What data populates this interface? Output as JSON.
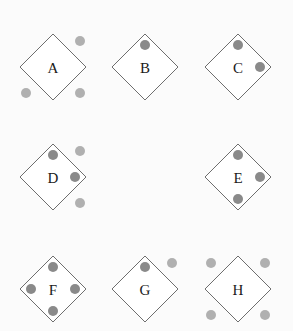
{
  "figure": {
    "colors": {
      "background": "#fbfbfb",
      "diamond_fill": "#ffffff",
      "diamond_stroke": "#6e6e6e",
      "dot_inside": "#8a8a8a",
      "dot_outside": "#b0b0b0",
      "label": "#1a1a1a"
    },
    "options": [
      {
        "label": "A",
        "dots": [
          {
            "position": "outside-top-right",
            "shade": "outside"
          },
          {
            "position": "outside-bottom-left",
            "shade": "outside"
          },
          {
            "position": "outside-bottom-right",
            "shade": "outside"
          }
        ]
      },
      {
        "label": "B",
        "dots": [
          {
            "position": "inside-top",
            "shade": "inside"
          }
        ]
      },
      {
        "label": "C",
        "dots": [
          {
            "position": "inside-top",
            "shade": "inside"
          },
          {
            "position": "inside-right",
            "shade": "inside"
          }
        ]
      },
      {
        "label": "D",
        "dots": [
          {
            "position": "inside-top",
            "shade": "inside"
          },
          {
            "position": "inside-right",
            "shade": "inside"
          },
          {
            "position": "outside-top-right",
            "shade": "outside"
          },
          {
            "position": "outside-bottom-right",
            "shade": "outside"
          }
        ]
      },
      {
        "label": "E",
        "dots": [
          {
            "position": "inside-top",
            "shade": "inside"
          },
          {
            "position": "inside-right",
            "shade": "inside"
          },
          {
            "position": "inside-bottom",
            "shade": "inside"
          }
        ]
      },
      {
        "label": "F",
        "dots": [
          {
            "position": "inside-top",
            "shade": "inside"
          },
          {
            "position": "inside-left",
            "shade": "inside"
          },
          {
            "position": "inside-right",
            "shade": "inside"
          },
          {
            "position": "inside-bottom",
            "shade": "inside"
          }
        ]
      },
      {
        "label": "G",
        "dots": [
          {
            "position": "inside-top",
            "shade": "inside"
          },
          {
            "position": "outside-top-right",
            "shade": "outside"
          }
        ]
      },
      {
        "label": "H",
        "dots": [
          {
            "position": "outside-top-left",
            "shade": "outside"
          },
          {
            "position": "outside-top-right",
            "shade": "outside"
          },
          {
            "position": "outside-bottom-left",
            "shade": "outside"
          },
          {
            "position": "outside-bottom-right",
            "shade": "outside"
          }
        ]
      }
    ]
  }
}
